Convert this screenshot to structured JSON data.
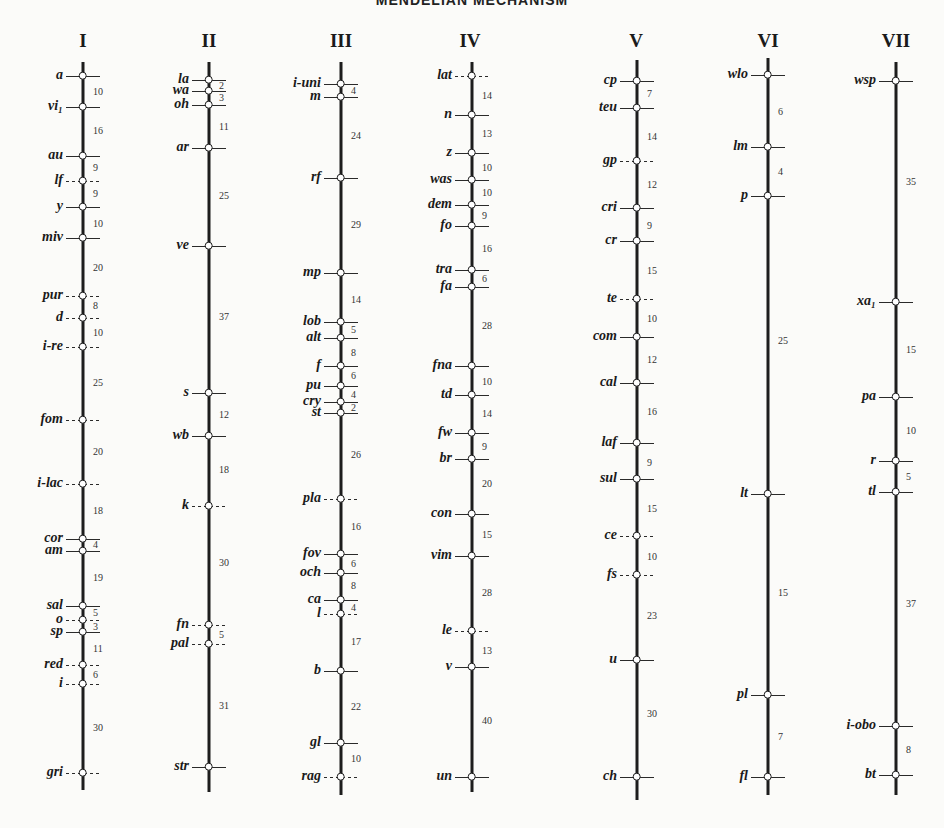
{
  "title": "MENDELIAN MECHANISM",
  "chromosomes": [
    {
      "label": "I",
      "x": 83,
      "labelX": 83,
      "top": 62,
      "bottom": 790,
      "genes": [
        {
          "name": "a",
          "y": 76,
          "dashed": false
        },
        {
          "name": "vi₁",
          "y": 107,
          "dashed": false
        },
        {
          "name": "au",
          "y": 156,
          "dashed": false
        },
        {
          "name": "lf",
          "y": 181,
          "dashed": true
        },
        {
          "name": "y",
          "y": 207,
          "dashed": false
        },
        {
          "name": "miv",
          "y": 238,
          "dashed": false
        },
        {
          "name": "pur",
          "y": 296,
          "dashed": true
        },
        {
          "name": "d",
          "y": 318,
          "dashed": true
        },
        {
          "name": "i-re",
          "y": 347,
          "dashed": true
        },
        {
          "name": "fom",
          "y": 420,
          "dashed": true
        },
        {
          "name": "i-lac",
          "y": 484,
          "dashed": true
        },
        {
          "name": "cor",
          "y": 539,
          "dashed": false
        },
        {
          "name": "am",
          "y": 551,
          "dashed": false
        },
        {
          "name": "sal",
          "y": 606,
          "dashed": false
        },
        {
          "name": "o",
          "y": 620,
          "dashed": true
        },
        {
          "name": "sp",
          "y": 632,
          "dashed": false
        },
        {
          "name": "red",
          "y": 665,
          "dashed": true
        },
        {
          "name": "i",
          "y": 684,
          "dashed": true
        },
        {
          "name": "gri",
          "y": 773,
          "dashed": true
        }
      ],
      "distances": [
        {
          "value": "10",
          "y": 92
        },
        {
          "value": "16",
          "y": 131
        },
        {
          "value": "9",
          "y": 168
        },
        {
          "value": "9",
          "y": 194
        },
        {
          "value": "10",
          "y": 224
        },
        {
          "value": "20",
          "y": 268
        },
        {
          "value": "8",
          "y": 306
        },
        {
          "value": "10",
          "y": 333
        },
        {
          "value": "25",
          "y": 383
        },
        {
          "value": "20",
          "y": 452
        },
        {
          "value": "18",
          "y": 511
        },
        {
          "value": "4",
          "y": 545
        },
        {
          "value": "19",
          "y": 578
        },
        {
          "value": "5",
          "y": 613
        },
        {
          "value": "3",
          "y": 627
        },
        {
          "value": "11",
          "y": 649
        },
        {
          "value": "6",
          "y": 675
        },
        {
          "value": "30",
          "y": 728
        }
      ]
    },
    {
      "label": "II",
      "x": 209,
      "labelX": 209,
      "top": 62,
      "bottom": 792,
      "genes": [
        {
          "name": "la",
          "y": 80,
          "dashed": false
        },
        {
          "name": "wa",
          "y": 91,
          "dashed": false
        },
        {
          "name": "oh",
          "y": 105,
          "dashed": false
        },
        {
          "name": "ar",
          "y": 148,
          "dashed": false
        },
        {
          "name": "ve",
          "y": 246,
          "dashed": false
        },
        {
          "name": "s",
          "y": 393,
          "dashed": false
        },
        {
          "name": "wb",
          "y": 436,
          "dashed": false
        },
        {
          "name": "k",
          "y": 506,
          "dashed": true
        },
        {
          "name": "fn",
          "y": 625,
          "dashed": true
        },
        {
          "name": "pal",
          "y": 644,
          "dashed": true
        },
        {
          "name": "str",
          "y": 767,
          "dashed": false
        }
      ],
      "distances": [
        {
          "value": "2",
          "y": 86
        },
        {
          "value": "3",
          "y": 98
        },
        {
          "value": "11",
          "y": 127
        },
        {
          "value": "25",
          "y": 196
        },
        {
          "value": "37",
          "y": 317
        },
        {
          "value": "12",
          "y": 415
        },
        {
          "value": "18",
          "y": 470
        },
        {
          "value": "30",
          "y": 563
        },
        {
          "value": "5",
          "y": 635
        },
        {
          "value": "31",
          "y": 706
        }
      ]
    },
    {
      "label": "III",
      "x": 341,
      "labelX": 341,
      "top": 62,
      "bottom": 795,
      "genes": [
        {
          "name": "i-uni",
          "y": 84,
          "dashed": false
        },
        {
          "name": "m",
          "y": 97,
          "dashed": false
        },
        {
          "name": "rf",
          "y": 178,
          "dashed": false
        },
        {
          "name": "mp",
          "y": 273,
          "dashed": false
        },
        {
          "name": "lob",
          "y": 322,
          "dashed": false
        },
        {
          "name": "alt",
          "y": 338,
          "dashed": false
        },
        {
          "name": "f",
          "y": 366,
          "dashed": false
        },
        {
          "name": "pu",
          "y": 386,
          "dashed": false
        },
        {
          "name": "cry",
          "y": 402,
          "dashed": false
        },
        {
          "name": "st",
          "y": 413,
          "dashed": false
        },
        {
          "name": "pla",
          "y": 499,
          "dashed": true
        },
        {
          "name": "fov",
          "y": 554,
          "dashed": false
        },
        {
          "name": "och",
          "y": 573,
          "dashed": false
        },
        {
          "name": "ca",
          "y": 600,
          "dashed": false
        },
        {
          "name": "l",
          "y": 614,
          "dashed": true
        },
        {
          "name": "b",
          "y": 671,
          "dashed": false
        },
        {
          "name": "gl",
          "y": 743,
          "dashed": false
        },
        {
          "name": "rag",
          "y": 777,
          "dashed": true
        }
      ],
      "distances": [
        {
          "value": "4",
          "y": 91
        },
        {
          "value": "24",
          "y": 136
        },
        {
          "value": "29",
          "y": 225
        },
        {
          "value": "14",
          "y": 300
        },
        {
          "value": "5",
          "y": 330
        },
        {
          "value": "8",
          "y": 353
        },
        {
          "value": "6",
          "y": 376
        },
        {
          "value": "4",
          "y": 395
        },
        {
          "value": "2",
          "y": 408
        },
        {
          "value": "26",
          "y": 455
        },
        {
          "value": "16",
          "y": 527
        },
        {
          "value": "6",
          "y": 564
        },
        {
          "value": "8",
          "y": 586
        },
        {
          "value": "4",
          "y": 608
        },
        {
          "value": "17",
          "y": 642
        },
        {
          "value": "22",
          "y": 707
        },
        {
          "value": "10",
          "y": 759
        }
      ]
    },
    {
      "label": "IV",
      "x": 472,
      "labelX": 470,
      "top": 62,
      "bottom": 792,
      "genes": [
        {
          "name": "lat",
          "y": 76,
          "dashed": true
        },
        {
          "name": "n",
          "y": 115,
          "dashed": false
        },
        {
          "name": "z",
          "y": 153,
          "dashed": false
        },
        {
          "name": "was",
          "y": 180,
          "dashed": false
        },
        {
          "name": "dem",
          "y": 205,
          "dashed": false
        },
        {
          "name": "fo",
          "y": 226,
          "dashed": false
        },
        {
          "name": "tra",
          "y": 270,
          "dashed": false
        },
        {
          "name": "fa",
          "y": 287,
          "dashed": false
        },
        {
          "name": "fna",
          "y": 366,
          "dashed": false
        },
        {
          "name": "td",
          "y": 395,
          "dashed": false
        },
        {
          "name": "fw",
          "y": 433,
          "dashed": false
        },
        {
          "name": "br",
          "y": 459,
          "dashed": false
        },
        {
          "name": "con",
          "y": 514,
          "dashed": false
        },
        {
          "name": "vim",
          "y": 556,
          "dashed": false
        },
        {
          "name": "le",
          "y": 631,
          "dashed": true
        },
        {
          "name": "v",
          "y": 667,
          "dashed": false
        },
        {
          "name": "un",
          "y": 777,
          "dashed": false
        }
      ],
      "distances": [
        {
          "value": "14",
          "y": 96
        },
        {
          "value": "13",
          "y": 134
        },
        {
          "value": "10",
          "y": 168
        },
        {
          "value": "10",
          "y": 193
        },
        {
          "value": "9",
          "y": 216
        },
        {
          "value": "16",
          "y": 249
        },
        {
          "value": "6",
          "y": 279
        },
        {
          "value": "28",
          "y": 326
        },
        {
          "value": "10",
          "y": 382
        },
        {
          "value": "14",
          "y": 414
        },
        {
          "value": "9",
          "y": 447
        },
        {
          "value": "20",
          "y": 484
        },
        {
          "value": "15",
          "y": 535
        },
        {
          "value": "28",
          "y": 593
        },
        {
          "value": "13",
          "y": 651
        },
        {
          "value": "40",
          "y": 721
        }
      ]
    },
    {
      "label": "V",
      "x": 637,
      "labelX": 636,
      "top": 60,
      "bottom": 800,
      "genes": [
        {
          "name": "cp",
          "y": 81,
          "dashed": false
        },
        {
          "name": "teu",
          "y": 108,
          "dashed": false
        },
        {
          "name": "gp",
          "y": 161,
          "dashed": true
        },
        {
          "name": "cri",
          "y": 208,
          "dashed": false
        },
        {
          "name": "cr",
          "y": 241,
          "dashed": false
        },
        {
          "name": "te",
          "y": 299,
          "dashed": true
        },
        {
          "name": "com",
          "y": 337,
          "dashed": false
        },
        {
          "name": "cal",
          "y": 383,
          "dashed": false
        },
        {
          "name": "laf",
          "y": 443,
          "dashed": false
        },
        {
          "name": "sul",
          "y": 479,
          "dashed": false
        },
        {
          "name": "ce",
          "y": 536,
          "dashed": true
        },
        {
          "name": "fs",
          "y": 575,
          "dashed": true
        },
        {
          "name": "u",
          "y": 660,
          "dashed": false
        },
        {
          "name": "ch",
          "y": 777,
          "dashed": false
        }
      ],
      "distances": [
        {
          "value": "7",
          "y": 94
        },
        {
          "value": "14",
          "y": 137
        },
        {
          "value": "12",
          "y": 185
        },
        {
          "value": "9",
          "y": 226
        },
        {
          "value": "15",
          "y": 271
        },
        {
          "value": "10",
          "y": 319
        },
        {
          "value": "12",
          "y": 360
        },
        {
          "value": "16",
          "y": 412
        },
        {
          "value": "9",
          "y": 463
        },
        {
          "value": "15",
          "y": 509
        },
        {
          "value": "10",
          "y": 557
        },
        {
          "value": "23",
          "y": 616
        },
        {
          "value": "30",
          "y": 714
        }
      ]
    },
    {
      "label": "VI",
      "x": 768,
      "labelX": 768,
      "top": 58,
      "bottom": 795,
      "genes": [
        {
          "name": "wlo",
          "y": 75,
          "dashed": false
        },
        {
          "name": "lm",
          "y": 147,
          "dashed": false
        },
        {
          "name": "p",
          "y": 196,
          "dashed": false
        },
        {
          "name": "lt",
          "y": 494,
          "dashed": false
        },
        {
          "name": "pl",
          "y": 695,
          "dashed": false
        },
        {
          "name": "fl",
          "y": 777,
          "dashed": false
        }
      ],
      "distances": [
        {
          "value": "6",
          "y": 112
        },
        {
          "value": "4",
          "y": 172
        },
        {
          "value": "25",
          "y": 341
        },
        {
          "value": "15",
          "y": 593
        },
        {
          "value": "7",
          "y": 737
        }
      ]
    },
    {
      "label": "VII",
      "x": 896,
      "labelX": 896,
      "top": 62,
      "bottom": 795,
      "genes": [
        {
          "name": "wsp",
          "y": 81,
          "dashed": false
        },
        {
          "name": "xa₁",
          "y": 302,
          "dashed": false
        },
        {
          "name": "pa",
          "y": 397,
          "dashed": false
        },
        {
          "name": "r",
          "y": 461,
          "dashed": false
        },
        {
          "name": "tl",
          "y": 492,
          "dashed": false
        },
        {
          "name": "i-obo",
          "y": 726,
          "dashed": false
        },
        {
          "name": "bt",
          "y": 775,
          "dashed": false
        }
      ],
      "distances": [
        {
          "value": "35",
          "y": 182
        },
        {
          "value": "15",
          "y": 350
        },
        {
          "value": "10",
          "y": 431
        },
        {
          "value": "5",
          "y": 477
        },
        {
          "value": "37",
          "y": 604
        },
        {
          "value": "8",
          "y": 750
        }
      ]
    }
  ]
}
